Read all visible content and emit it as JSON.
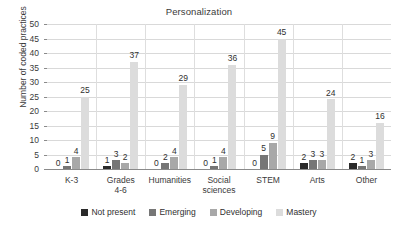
{
  "chart_data": {
    "type": "bar",
    "title": "Personalization",
    "xlabel": "",
    "ylabel": "Number of coded practices",
    "ylim": [
      0,
      50
    ],
    "ytick_step": 5,
    "yticks": [
      0,
      5,
      10,
      15,
      20,
      25,
      30,
      35,
      40,
      45,
      50
    ],
    "grid": true,
    "legend_position": "bottom",
    "categories": [
      "K-3",
      "Grades\n4-6",
      "Humanities",
      "Social\nsciences",
      "STEM",
      "Arts",
      "Other"
    ],
    "series": [
      {
        "name": "Not present",
        "color": "#2a2a2a",
        "values": [
          0,
          1,
          0,
          0,
          0,
          2,
          2
        ]
      },
      {
        "name": "Emerging",
        "color": "#767676",
        "values": [
          1,
          3,
          2,
          1,
          5,
          3,
          1
        ]
      },
      {
        "name": "Developing",
        "color": "#a8a8a8",
        "values": [
          4,
          2,
          4,
          4,
          9,
          3,
          3
        ]
      },
      {
        "name": "Mastery",
        "color": "#dcdcdc",
        "values": [
          25,
          37,
          29,
          36,
          45,
          24,
          16
        ]
      }
    ],
    "data_labels": true
  }
}
